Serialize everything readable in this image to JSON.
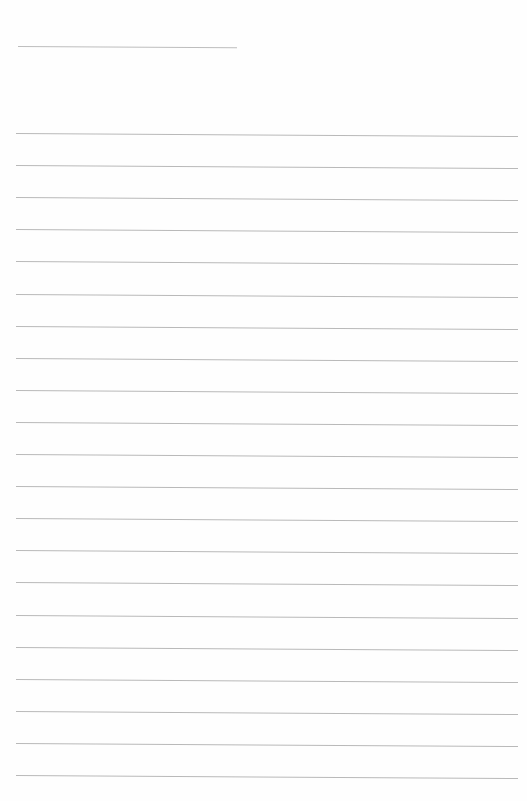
{
  "page": {
    "type": "lined-paper",
    "background_color": "#fefefe",
    "line_color": "#b9b9b9",
    "header_line": {
      "x1": 18,
      "x2": 237,
      "y": 46
    },
    "ruled_lines": {
      "count": 21,
      "first_y": 133,
      "spacing": 32.1,
      "x1": 16,
      "x2": 518,
      "slope_px": 3
    }
  }
}
